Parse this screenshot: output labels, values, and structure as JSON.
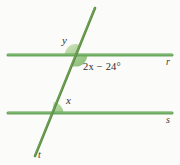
{
  "figure": {
    "background_color": "#fbfbfa",
    "line_color": "#5f9e55",
    "transversal_color": "#58863f",
    "wedge_fill_color": "#9fc98c",
    "text_color": "#2f2f2f"
  },
  "labels": {
    "angle_y": "y",
    "angle_x": "x",
    "angle_expression": "2x − 24°",
    "line_r": "r",
    "line_s": "s",
    "line_t": "t"
  },
  "lines": {
    "r": {
      "name": "r",
      "type": "horizontal",
      "y": 55,
      "x_start": 8,
      "x_end": 172
    },
    "s": {
      "name": "s",
      "type": "horizontal",
      "y": 113,
      "x_start": 8,
      "x_end": 172
    },
    "t": {
      "name": "t",
      "type": "transversal",
      "x_top": 95,
      "y_top": 8,
      "x_bottom": 35,
      "y_bottom": 156
    }
  },
  "angles": [
    {
      "id": "y",
      "label": "y",
      "vertex": "top-intersection",
      "position": "upper-left"
    },
    {
      "id": "expr",
      "label": "2x − 24°",
      "vertex": "top-intersection",
      "position": "lower-right"
    },
    {
      "id": "x",
      "label": "x",
      "vertex": "bottom-intersection",
      "position": "upper-right"
    }
  ]
}
